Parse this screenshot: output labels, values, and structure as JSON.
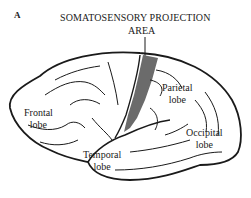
{
  "figure": {
    "panel_label": "A",
    "title_line1": "SOMATOSENSORY PROJECTION",
    "title_line2": "AREA",
    "highlight_color": "#6b6b6b"
  },
  "labels": {
    "frontal": {
      "line1": "Frontal",
      "line2": "lobe"
    },
    "parietal": {
      "line1": "Parietal",
      "line2": "lobe"
    },
    "occipital": {
      "line1": "Occipital",
      "line2": "lobe"
    },
    "temporal": {
      "line1": "Temporal",
      "line2": "lobe"
    }
  }
}
